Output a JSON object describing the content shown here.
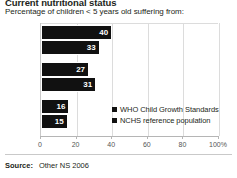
{
  "header": {
    "title": "Current nutritional status",
    "subtitle": "Percentage of children < 5 years old suffering from:"
  },
  "footer": {
    "label": "Source:",
    "value": "Other NS 2006"
  },
  "chart_data": {
    "type": "bar",
    "orientation": "horizontal",
    "title": "Current nutritional status",
    "subtitle": "Percentage of children < 5 years old suffering from:",
    "categories": [
      "Stunting",
      "Underweight",
      "Wasting"
    ],
    "series": [
      {
        "name": "WHO Child Growth Standards",
        "values": [
          40,
          27,
          16
        ],
        "color": "#111111"
      },
      {
        "name": "NCHS reference population",
        "values": [
          33,
          31,
          15
        ],
        "color": "#111111"
      }
    ],
    "xlabel": "",
    "ylabel": "",
    "xlim": [
      0,
      100
    ],
    "xticks": [
      0,
      20,
      40,
      60,
      80,
      100
    ],
    "xtick_labels": [
      "0",
      "20",
      "40",
      "60",
      "80",
      "100%"
    ],
    "grid": true,
    "legend_position": "inside-right"
  }
}
